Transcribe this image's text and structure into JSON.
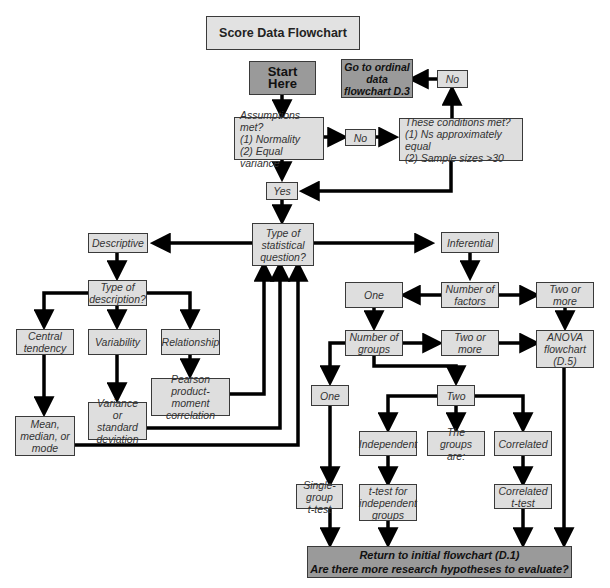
{
  "title": "Score Data Flowchart",
  "nodes": {
    "start": "Start Here",
    "assumptions": "Assumptions met?\n(1) Normality\n(2) Equal variance",
    "no_1": "No",
    "conditions": "These conditions met?\n(1) Ns approximately equal\n(2) Sample sizes >30",
    "no_2": "No",
    "ordinal": "Go to ordinal\ndata\nflowchart D.3",
    "yes": "Yes",
    "question_type": "Type of\nstatistical\nquestion?",
    "descriptive": "Descriptive",
    "inferential": "Inferential",
    "description_type": "Type of\ndescription?",
    "central_tendency": "Central\ntendency",
    "variability": "Variability",
    "relationship": "Relationship",
    "pearson": "Pearson\nproduct-moment\ncorrelation",
    "variance_sd": "Variance or\nstandard\ndeviation",
    "mean_median_mode": "Mean,\nmedian, or\nmode",
    "number_of_factors": "Number of\nfactors",
    "factors_one": "One",
    "factors_two_more": "Two or\nmore",
    "number_of_groups": "Number of\ngroups",
    "groups_two_more": "Two or\nmore",
    "anova": "ANOVA\nflowchart\n(D.5)",
    "groups_one": "One",
    "groups_two": "Two",
    "independent": "Independent",
    "groups_are": "The groups\nare:",
    "correlated": "Correlated",
    "single_group_t": "Single-group\nt-test",
    "independent_t": "t-test for\nindependent\ngroups",
    "correlated_t": "Correlated\nt-test",
    "final": "Return to initial flowchart (D.1)\nAre there more research hypotheses to evaluate?"
  },
  "colors": {
    "box_fill": "#dedede",
    "dark_fill": "#9a9a9a",
    "border": "#3a3a3a",
    "arrow": "#000000"
  }
}
